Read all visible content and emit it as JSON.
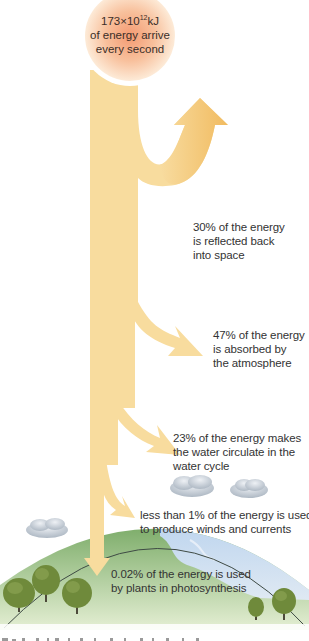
{
  "diagram": {
    "type": "energy-flow",
    "sun": {
      "value_base": "173",
      "times": "×",
      "power_base": "10",
      "exponent": "12",
      "unit": "kJ",
      "line2": "of energy arrive",
      "line3": "every second"
    },
    "flows": [
      {
        "percent": "30%",
        "line1": "30% of the energy",
        "line2": "is reflected back",
        "line3": "into space",
        "direction": "up-out"
      },
      {
        "percent": "47%",
        "line1": "47% of the energy",
        "line2": "is absorbed by",
        "line3": "the atmosphere",
        "direction": "down-right"
      },
      {
        "percent": "23%",
        "line1": "23% of the energy makes",
        "line2": "the water circulate in the",
        "line3": "water cycle",
        "direction": "down-right"
      },
      {
        "percent": "<1%",
        "line1": "less than 1% of the energy is used",
        "line2": "to produce winds and currents",
        "direction": "down-right"
      },
      {
        "percent": "0.02%",
        "line1": "0.02% of the energy is used",
        "line2": "by plants in photosynthesis",
        "direction": "down"
      }
    ],
    "colors": {
      "arrow": "#f8dc9e",
      "arrow_dark": "#f1bf6a",
      "sun_center": "#f5a77d",
      "sun_edge": "#fde7cf",
      "land": "#8fb57a",
      "sea": "#c9dcef",
      "tree": "#6f8a3b",
      "cloud": "#c3ccd6"
    }
  }
}
